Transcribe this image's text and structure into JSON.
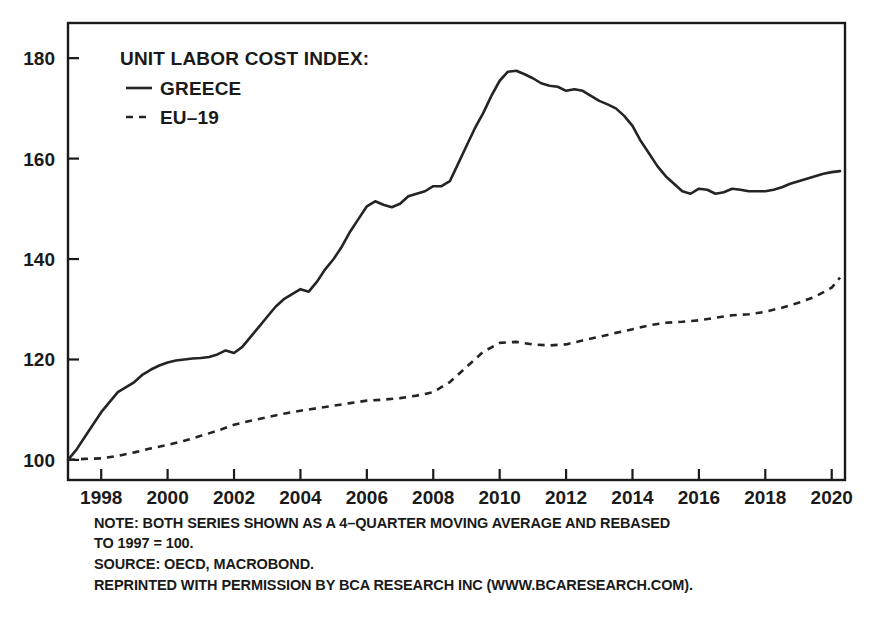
{
  "chart_data": {
    "type": "line",
    "title": "UNIT LABOR COST INDEX:",
    "xlabel": "",
    "ylabel": "",
    "xlim": [
      1997.0,
      2020.4
    ],
    "ylim": [
      96,
      187
    ],
    "grid": false,
    "legend_position": "top-left inside plot",
    "yticks": [
      100,
      120,
      140,
      160,
      180
    ],
    "ytick_labels": [
      "100",
      "120",
      "140",
      "160",
      "180"
    ],
    "xticks": [
      1998,
      2000,
      2002,
      2004,
      2006,
      2008,
      2010,
      2012,
      2014,
      2016,
      2018,
      2020
    ],
    "xtick_labels": [
      "1998",
      "2000",
      "2002",
      "2004",
      "2006",
      "2008",
      "2010",
      "2012",
      "2014",
      "2016",
      "2018",
      "2020"
    ],
    "series": [
      {
        "name": "GREECE",
        "style": "solid",
        "color": "#242424",
        "x": [
          1997.0,
          1997.25,
          1997.5,
          1997.75,
          1998.0,
          1998.25,
          1998.5,
          1998.75,
          1999.0,
          1999.25,
          1999.5,
          1999.75,
          2000.0,
          2000.25,
          2000.5,
          2000.75,
          2001.0,
          2001.25,
          2001.5,
          2001.75,
          2002.0,
          2002.25,
          2002.5,
          2002.75,
          2003.0,
          2003.25,
          2003.5,
          2003.75,
          2004.0,
          2004.25,
          2004.5,
          2004.75,
          2005.0,
          2005.25,
          2005.5,
          2005.75,
          2006.0,
          2006.25,
          2006.5,
          2006.75,
          2007.0,
          2007.25,
          2007.5,
          2007.75,
          2008.0,
          2008.25,
          2008.5,
          2008.75,
          2009.0,
          2009.25,
          2009.5,
          2009.75,
          2010.0,
          2010.25,
          2010.5,
          2010.75,
          2011.0,
          2011.25,
          2011.5,
          2011.75,
          2012.0,
          2012.25,
          2012.5,
          2012.75,
          2013.0,
          2013.25,
          2013.5,
          2013.75,
          2014.0,
          2014.25,
          2014.5,
          2014.75,
          2015.0,
          2015.25,
          2015.5,
          2015.75,
          2016.0,
          2016.25,
          2016.5,
          2016.75,
          2017.0,
          2017.25,
          2017.5,
          2017.75,
          2018.0,
          2018.25,
          2018.5,
          2018.75,
          2019.0,
          2019.25,
          2019.5,
          2019.75,
          2020.0,
          2020.25
        ],
        "values": [
          100.0,
          102.0,
          104.5,
          107.0,
          109.5,
          111.5,
          113.5,
          114.5,
          115.5,
          117.0,
          118.0,
          118.8,
          119.4,
          119.8,
          120.0,
          120.2,
          120.3,
          120.5,
          121.0,
          121.8,
          121.3,
          122.5,
          124.5,
          126.5,
          128.5,
          130.5,
          132.0,
          133.0,
          134.0,
          133.5,
          135.5,
          138.0,
          140.0,
          142.5,
          145.5,
          148.0,
          150.5,
          151.5,
          150.8,
          150.3,
          151.0,
          152.5,
          153.0,
          153.5,
          154.5,
          154.5,
          155.5,
          159.0,
          162.5,
          166.0,
          169.0,
          172.5,
          175.5,
          177.3,
          177.5,
          176.8,
          176.0,
          175.0,
          174.5,
          174.3,
          173.5,
          173.8,
          173.5,
          172.5,
          171.5,
          170.8,
          170.0,
          168.5,
          166.5,
          163.5,
          161.0,
          158.5,
          156.5,
          155.0,
          153.5,
          153.0,
          154.0,
          153.8,
          153.0,
          153.3,
          154.0,
          153.8,
          153.5,
          153.5,
          153.5,
          153.8,
          154.3,
          155.0,
          155.5,
          156.0,
          156.5,
          157.0,
          157.3,
          157.5
        ]
      },
      {
        "name": "EU–19",
        "style": "dashed",
        "color": "#242424",
        "x": [
          1997.0,
          1997.5,
          1998.0,
          1998.5,
          1999.0,
          1999.5,
          2000.0,
          2000.5,
          2001.0,
          2001.5,
          2002.0,
          2002.5,
          2003.0,
          2003.5,
          2004.0,
          2004.5,
          2005.0,
          2005.5,
          2006.0,
          2006.5,
          2007.0,
          2007.5,
          2008.0,
          2008.5,
          2009.0,
          2009.5,
          2010.0,
          2010.5,
          2011.0,
          2011.5,
          2012.0,
          2012.5,
          2013.0,
          2013.5,
          2014.0,
          2014.5,
          2015.0,
          2015.5,
          2016.0,
          2016.5,
          2017.0,
          2017.5,
          2018.0,
          2018.5,
          2019.0,
          2019.5,
          2020.0,
          2020.25
        ],
        "values": [
          100.0,
          100.2,
          100.3,
          100.8,
          101.5,
          102.3,
          103.0,
          103.8,
          104.8,
          105.8,
          107.0,
          107.8,
          108.5,
          109.2,
          109.8,
          110.3,
          110.8,
          111.3,
          111.8,
          112.0,
          112.3,
          112.8,
          113.5,
          115.5,
          118.5,
          121.5,
          123.3,
          123.5,
          123.0,
          122.8,
          123.0,
          123.8,
          124.5,
          125.3,
          126.0,
          126.8,
          127.3,
          127.5,
          127.8,
          128.3,
          128.8,
          129.0,
          129.5,
          130.3,
          131.3,
          132.5,
          134.3,
          136.3
        ]
      }
    ],
    "notes": [
      "NOTE: BOTH SERIES SHOWN AS A 4–QUARTER MOVING AVERAGE AND REBASED",
      "TO 1997 = 100.",
      "SOURCE: OECD, MACROBOND.",
      "REPRINTED WITH PERMISSION BY BCA RESEARCH INC (WWW.BCARESEARCH.COM)."
    ]
  }
}
